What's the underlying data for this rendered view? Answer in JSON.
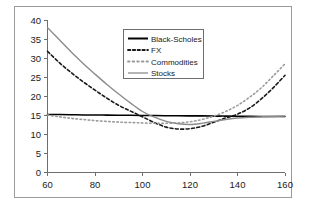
{
  "chart_data": {
    "type": "line",
    "title": "",
    "subtitle": "",
    "xlabel": "",
    "ylabel": "",
    "xlim": [
      60,
      160
    ],
    "ylim": [
      0,
      40
    ],
    "grid": false,
    "legend_position": "inside-upper-center",
    "xticks": [
      "60",
      "80",
      "100",
      "120",
      "140",
      "160"
    ],
    "xtick_values": [
      60,
      80,
      100,
      120,
      140,
      160
    ],
    "yticks": [
      "0",
      "5",
      "10",
      "15",
      "20",
      "25",
      "30",
      "35",
      "40"
    ],
    "ytick_values": [
      0,
      5,
      10,
      15,
      20,
      25,
      30,
      35,
      40
    ],
    "x": [
      60,
      65,
      70,
      75,
      80,
      85,
      90,
      95,
      100,
      105,
      110,
      115,
      120,
      125,
      130,
      135,
      140,
      145,
      150,
      155,
      160
    ],
    "series": [
      {
        "name": "Black-Scholes",
        "color": "#000000",
        "style": "solid",
        "width": 1.6,
        "values": [
          15.2,
          15.2,
          15.15,
          15.1,
          15.1,
          15.05,
          15.0,
          15.0,
          14.95,
          14.95,
          14.9,
          14.9,
          14.85,
          14.85,
          14.8,
          14.8,
          14.75,
          14.75,
          14.7,
          14.7,
          14.7
        ]
      },
      {
        "name": "FX",
        "color": "#1a1a1a",
        "style": "dashed",
        "width": 1.6,
        "values": [
          31.8,
          28.8,
          26.2,
          23.8,
          21.6,
          19.5,
          17.6,
          16.1,
          14.6,
          13.1,
          11.9,
          11.4,
          11.5,
          12.1,
          13.2,
          14.3,
          15.3,
          16.9,
          19.3,
          22.2,
          25.5
        ]
      },
      {
        "name": "Commodities",
        "color": "#9a9a9a",
        "style": "dotted",
        "width": 1.6,
        "values": [
          15.1,
          14.6,
          14.2,
          13.9,
          13.6,
          13.4,
          13.2,
          13.1,
          13.0,
          12.9,
          12.9,
          13.0,
          13.3,
          13.9,
          14.8,
          16.0,
          17.6,
          19.7,
          22.2,
          25.3,
          28.5
        ]
      },
      {
        "name": "Stocks",
        "color": "#8c8c8c",
        "style": "solid",
        "width": 1.4,
        "values": [
          38.0,
          34.8,
          31.6,
          28.6,
          25.8,
          23.1,
          20.6,
          18.2,
          16.0,
          14.5,
          13.4,
          12.8,
          12.6,
          12.9,
          13.4,
          13.9,
          14.3,
          14.5,
          14.6,
          14.7,
          14.8
        ]
      }
    ],
    "legend_entries": [
      {
        "label": "Black-Scholes",
        "color": "#000000",
        "style": "solid"
      },
      {
        "label": "FX",
        "color": "#1a1a1a",
        "style": "dashed"
      },
      {
        "label": "Commodities",
        "color": "#9a9a9a",
        "style": "dotted"
      },
      {
        "label": "Stocks",
        "color": "#8c8c8c",
        "style": "solid"
      }
    ]
  },
  "axes": {
    "x_tick_0": "60",
    "x_tick_1": "80",
    "x_tick_2": "100",
    "x_tick_3": "120",
    "x_tick_4": "140",
    "x_tick_5": "160",
    "y_tick_0": "0",
    "y_tick_1": "5",
    "y_tick_2": "10",
    "y_tick_3": "15",
    "y_tick_4": "20",
    "y_tick_5": "25",
    "y_tick_6": "30",
    "y_tick_7": "35",
    "y_tick_8": "40"
  },
  "legend": {
    "item_0": "Black-Scholes",
    "item_1": "FX",
    "item_2": "Commodities",
    "item_3": "Stocks"
  },
  "colors": {
    "frame": "#9a9a9a",
    "axis": "#6e6e6e",
    "black_scholes": "#000000",
    "fx": "#1a1a1a",
    "commodities": "#9a9a9a",
    "stocks": "#8c8c8c",
    "background": "#ffffff"
  }
}
